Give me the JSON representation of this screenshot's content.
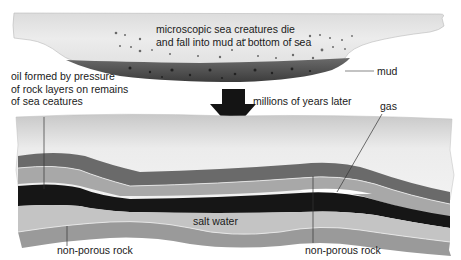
{
  "diagram": {
    "stage_top": {
      "caption_line1": "microscopic sea creatures die",
      "caption_line2": "and fall into mud at bottom of sea",
      "mud_label": "mud"
    },
    "transition": {
      "arrow_icon": "down-arrow",
      "label": "millions of years later"
    },
    "stage_bottom": {
      "oil_label_line1": "oil formed by pressure",
      "oil_label_line2": "of rock layers on remains",
      "oil_label_line3": "of sea ceatures",
      "gas_label": "gas",
      "salt_water_label": "salt water",
      "non_porous_rock_left": "non-porous rock",
      "non_porous_rock_right": "non-porous rock"
    },
    "colors": {
      "sea": "#e4e4e4",
      "mud": "#4a4a4a",
      "rock_dark": "#6a6a6a",
      "porous_rock": "#a8a8a8",
      "oil": "#161616",
      "salt_water": "#c4c4c4",
      "non_porous_rock": "#9a9a9a",
      "gas": "#ffffff"
    }
  }
}
